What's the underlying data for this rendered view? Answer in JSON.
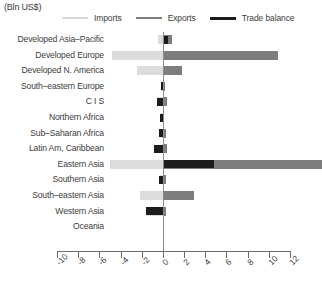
{
  "units_label": "(Bln US$)",
  "legend": {
    "items": [
      {
        "label": "Imports",
        "key": "imports",
        "color": "#d9d9d9"
      },
      {
        "label": "Exports",
        "key": "exports",
        "color": "#7d7d7d"
      },
      {
        "label": "Trade balance",
        "key": "balance",
        "color": "#1c1c1c"
      }
    ]
  },
  "axis": {
    "min": -10,
    "max": 12,
    "step": 2,
    "ticks": [
      -10,
      -8,
      -6,
      -4,
      -2,
      0,
      2,
      4,
      6,
      8,
      10,
      12
    ],
    "tick_labels": [
      "-10",
      "-8",
      "-6",
      "-4",
      "-2",
      "0",
      "2",
      "4",
      "6",
      "8",
      "10",
      "12"
    ]
  },
  "categories": [
    "Developed Asia–Pacific",
    "Developed Europe",
    "Developed N. America",
    "South–eastern Europe",
    "C I S",
    "Northern Africa",
    "Sub–Saharan Africa",
    "Latin Am, Caribbean",
    "Eastern Asia",
    "Southern Asia",
    "South–eastern Asia",
    "Western Asia",
    "Oceania"
  ],
  "chart_data": {
    "type": "bar",
    "orientation": "horizontal",
    "title": "",
    "subtitle": "",
    "xlabel": "",
    "ylabel": "",
    "unit": "Bln US$",
    "xlim": [
      -10,
      12
    ],
    "grid": false,
    "legend_position": "top",
    "categories": [
      "Developed Asia–Pacific",
      "Developed Europe",
      "Developed N. America",
      "South–eastern Europe",
      "C I S",
      "Northern Africa",
      "Sub–Saharan Africa",
      "Latin Am, Caribbean",
      "Eastern Asia",
      "Southern Asia",
      "South–eastern Asia",
      "Western Asia",
      "Oceania"
    ],
    "series": [
      {
        "name": "Imports",
        "color": "#d9d9d9",
        "values": [
          -0.5,
          -4.8,
          -2.4,
          -0.2,
          -0.5,
          -0.15,
          -0.3,
          -0.15,
          -5.0,
          -0.3,
          -2.2,
          -1.5,
          0.0
        ]
      },
      {
        "name": "Exports",
        "color": "#7d7d7d",
        "values": [
          0.9,
          10.9,
          1.8,
          0.2,
          0.4,
          0.15,
          0.25,
          0.35,
          15.0,
          0.25,
          2.9,
          0.3,
          0.0
        ]
      },
      {
        "name": "Trade balance",
        "color": "#1c1c1c",
        "values": [
          0.45,
          0.0,
          0.0,
          -0.2,
          -0.6,
          -0.3,
          -0.35,
          -0.85,
          4.8,
          -0.4,
          0.0,
          -1.6,
          0.0
        ]
      }
    ]
  }
}
